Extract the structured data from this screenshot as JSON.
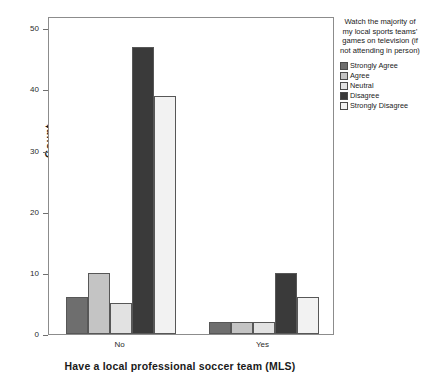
{
  "chart_data": {
    "type": "bar",
    "title": "",
    "xlabel": "Have a local professional soccer team (MLS)",
    "ylabel": "Count",
    "categories": [
      "No",
      "Yes"
    ],
    "series": [
      {
        "name": "Strongly Agree",
        "color": "#6e6e6e",
        "values": [
          6,
          2
        ]
      },
      {
        "name": "Agree",
        "color": "#c4c4c4",
        "values": [
          10,
          2
        ]
      },
      {
        "name": "Neutral",
        "color": "#e2e2e2",
        "values": [
          5,
          2
        ]
      },
      {
        "name": "Disagree",
        "color": "#3a3a3a",
        "values": [
          47,
          10
        ]
      },
      {
        "name": "Strongly Disagree",
        "color": "#f2f2f2",
        "values": [
          39,
          6
        ]
      }
    ],
    "ylim": [
      0,
      52
    ],
    "yticks": [
      0,
      10,
      20,
      30,
      40,
      50
    ],
    "ytick_labels": [
      "0",
      "10",
      "20",
      "30",
      "40",
      "50"
    ],
    "grid": false,
    "legend_position": "right",
    "legend_title": "Watch the majority of my local sports teams’ games on television (if not attending in person)"
  },
  "axes": {
    "y_title": "Count",
    "x_title": "Have a local professional soccer team (MLS)"
  },
  "legend": {
    "title": "Watch the majority of my local sports teams’ games on television (if not attending in person)",
    "items": [
      {
        "label": "Strongly Agree"
      },
      {
        "label": "Agree"
      },
      {
        "label": "Neutral"
      },
      {
        "label": "Disagree"
      },
      {
        "label": "Strongly Disagree"
      }
    ]
  }
}
